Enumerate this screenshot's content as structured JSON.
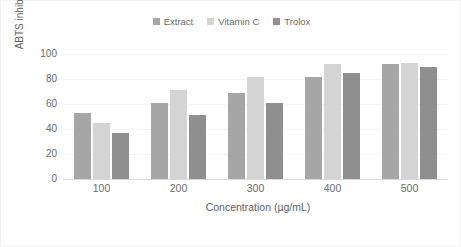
{
  "chart_data": {
    "type": "bar",
    "title": "",
    "subtitle": "",
    "xlabel": "Concentration (µg/mL)",
    "ylabel": "ABTS inhibition (%)",
    "categories": [
      "100",
      "200",
      "300",
      "400",
      "500"
    ],
    "series": [
      {
        "name": "Extract",
        "values": [
          53,
          61,
          69,
          82,
          92
        ],
        "color": "#a6a6a6"
      },
      {
        "name": "Vitamin C",
        "values": [
          45,
          71,
          82,
          92,
          93
        ],
        "color": "#d4d4d4"
      },
      {
        "name": "Trolox",
        "values": [
          37,
          51,
          61,
          85,
          90
        ],
        "color": "#8f8f8f"
      }
    ],
    "ylim": [
      0,
      100
    ],
    "yticks": [
      "100",
      "80",
      "60",
      "40",
      "20",
      "0"
    ],
    "ytick_values": [
      100,
      80,
      60,
      40,
      20,
      0
    ],
    "grid": true,
    "grid_axis": "y",
    "legend_position": "top",
    "axis_color": "#d9d9d9",
    "gridline_color": "#f4f4f4",
    "text_color": "#6b6b6b",
    "background": "#ffffff"
  }
}
